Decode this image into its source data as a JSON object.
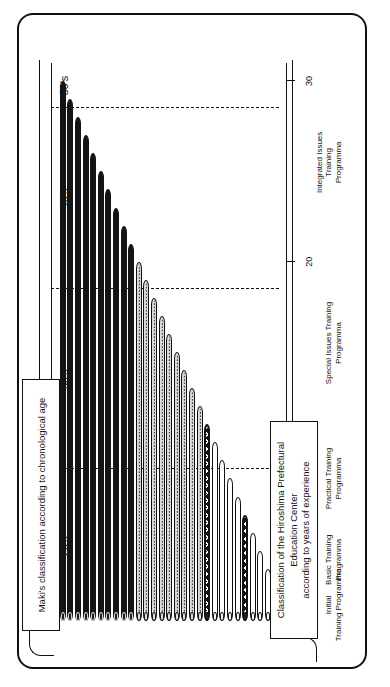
{
  "figure": {
    "orientation": "rotated-90-ccw",
    "frame_border_color": "#111111",
    "background": "#ffffff"
  },
  "callouts": {
    "age": {
      "label": "Maki's classification according to chronological age",
      "position": "left"
    },
    "experience": {
      "label": "Classification of the Hiroshima Prefectural Education Center\naccording to years of experience",
      "position": "right"
    }
  },
  "chart_data": {
    "type": "bar",
    "orientation": "horizontal",
    "title": "",
    "xlabel": "",
    "ylabel": "",
    "grid": false,
    "legend_position": "none",
    "axis": {
      "tick_values": [
        1,
        5,
        10,
        20,
        30
      ],
      "tick_labels": [
        "1",
        "5",
        "10",
        "20",
        "30"
      ],
      "range": [
        0,
        31
      ]
    },
    "age_groups": [
      {
        "label": "20's",
        "start": 0,
        "end": 8.5
      },
      {
        "label": "30's",
        "start": 8.5,
        "end": 18.5
      },
      {
        "label": "40's",
        "start": 18.5,
        "end": 28.5
      },
      {
        "label": "50's",
        "start": 28.5,
        "end": 31
      }
    ],
    "age_separators": [
      8.5,
      18.5,
      28.5
    ],
    "categories": [
      {
        "label": "Initial\nTraining Programma",
        "pattern": "cross-hatch",
        "start": 1,
        "end": 1
      },
      {
        "label": "Basic Training\nProgramma",
        "pattern": "white",
        "start": 2,
        "end": 5
      },
      {
        "label": "Practical Training\nProgramma",
        "pattern": "dots",
        "start": 6,
        "end": 10
      },
      {
        "label": "Special Issues Training\nProgramma",
        "pattern": "stipple",
        "start": 11,
        "end": 20
      },
      {
        "label": "Integrated Issues Training\nProgramma",
        "pattern": "solid",
        "start": 21,
        "end": 30
      }
    ],
    "bars": [
      {
        "index": 1,
        "value": 1,
        "pattern": "cross-hatch"
      },
      {
        "index": 2,
        "value": 2,
        "pattern": "white"
      },
      {
        "index": 3,
        "value": 3,
        "pattern": "white"
      },
      {
        "index": 4,
        "value": 4,
        "pattern": "white"
      },
      {
        "index": 5,
        "value": 5,
        "pattern": "white"
      },
      {
        "index": 6,
        "value": 6,
        "pattern": "cross-hatch"
      },
      {
        "index": 7,
        "value": 7,
        "pattern": "dots"
      },
      {
        "index": 8,
        "value": 8,
        "pattern": "dots"
      },
      {
        "index": 9,
        "value": 9,
        "pattern": "dots"
      },
      {
        "index": 10,
        "value": 10,
        "pattern": "dots"
      },
      {
        "index": 11,
        "value": 11,
        "pattern": "cross-hatch"
      },
      {
        "index": 12,
        "value": 12,
        "pattern": "stipple"
      },
      {
        "index": 13,
        "value": 13,
        "pattern": "stipple"
      },
      {
        "index": 14,
        "value": 14,
        "pattern": "stipple"
      },
      {
        "index": 15,
        "value": 15,
        "pattern": "stipple"
      },
      {
        "index": 16,
        "value": 16,
        "pattern": "stipple"
      },
      {
        "index": 17,
        "value": 17,
        "pattern": "stipple"
      },
      {
        "index": 18,
        "value": 18,
        "pattern": "stipple"
      },
      {
        "index": 19,
        "value": 19,
        "pattern": "stipple"
      },
      {
        "index": 20,
        "value": 20,
        "pattern": "stipple"
      },
      {
        "index": 21,
        "value": 21,
        "pattern": "solid"
      },
      {
        "index": 22,
        "value": 22,
        "pattern": "solid"
      },
      {
        "index": 23,
        "value": 23,
        "pattern": "solid"
      },
      {
        "index": 24,
        "value": 24,
        "pattern": "solid"
      },
      {
        "index": 25,
        "value": 25,
        "pattern": "solid"
      },
      {
        "index": 26,
        "value": 26,
        "pattern": "solid"
      },
      {
        "index": 27,
        "value": 27,
        "pattern": "solid"
      },
      {
        "index": 28,
        "value": 28,
        "pattern": "solid"
      },
      {
        "index": 29,
        "value": 29,
        "pattern": "solid"
      },
      {
        "index": 30,
        "value": 30,
        "pattern": "solid"
      }
    ]
  }
}
